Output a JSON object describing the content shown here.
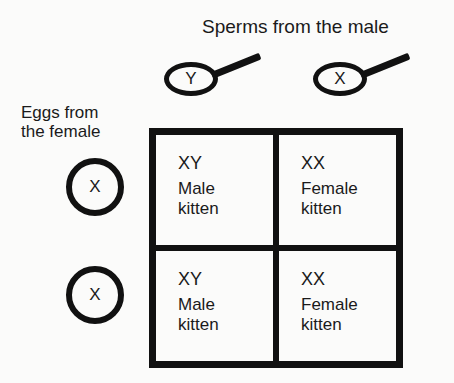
{
  "title": "Sperms from the male",
  "sperms": [
    {
      "label": "Y"
    },
    {
      "label": "X"
    }
  ],
  "eggs_label": [
    "Eggs from",
    "the female"
  ],
  "eggs": [
    {
      "label": "X"
    },
    {
      "label": "X"
    }
  ],
  "punnett": {
    "cells": [
      {
        "genotype": "XY",
        "sex": "Male",
        "kind": "kitten"
      },
      {
        "genotype": "XX",
        "sex": "Female",
        "kind": "kitten"
      },
      {
        "genotype": "XY",
        "sex": "Male",
        "kind": "kitten"
      },
      {
        "genotype": "XX",
        "sex": "Female",
        "kind": "kitten"
      }
    ]
  }
}
